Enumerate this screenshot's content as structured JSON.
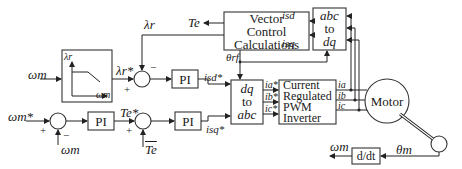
{
  "diagram": {
    "blocks": {
      "vector_control": [
        "Vector",
        "Control",
        "Calculations"
      ],
      "abc_to_dq": [
        "abc",
        "to",
        "dq"
      ],
      "dq_to_abc": [
        "dq",
        "to",
        "abc"
      ],
      "inverter": [
        "Current",
        "Regulated",
        "PWM",
        "Inverter"
      ],
      "motor": "Motor",
      "pi_speed": "PI",
      "pi_flux": "PI",
      "pi_torque": "PI",
      "derivative": "d/dt",
      "flux_weakening": {
        "y_axis": "λr",
        "x_axis": "ωm"
      }
    },
    "signals": {
      "omega_m_input": "ωm",
      "omega_m_ref": "ωm*",
      "omega_m_feedback": "ωm",
      "omega_m_output": "ωm",
      "theta_m": "θm",
      "lambda_r_ref": "λr*",
      "lambda_r": "λr",
      "T_e_ref": "Te*",
      "T_e": "Te",
      "T_e_bar": "Te",
      "i_sd_ref": "isd*",
      "i_sq_ref": "isq*",
      "i_sd": "isd",
      "i_sq": "isq",
      "theta_rf": "θrf",
      "i_a_ref": "ia*",
      "i_b_ref": "ib*",
      "i_c_ref": "ic*",
      "i_a": "ia",
      "i_b": "ib",
      "i_c": "ic"
    },
    "signs": {
      "plus": "+",
      "minus": "−"
    }
  }
}
